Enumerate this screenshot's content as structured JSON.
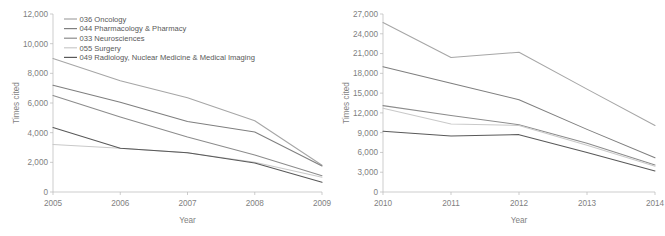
{
  "figure": {
    "panels": [
      "left",
      "right"
    ],
    "shared_legend_panel": "left"
  },
  "legend": {
    "entries": [
      {
        "label": "036 Oncology",
        "color": "#a6a6a6"
      },
      {
        "label": "044 Pharmacology & Pharmacy",
        "color": "#7f7f7f"
      },
      {
        "label": "033 Neurosciences",
        "color": "#8c8c8c"
      },
      {
        "label": "055 Surgery",
        "color": "#c9c9c9"
      },
      {
        "label": "049 Radiology, Nuclear Medicine & Medical Imaging",
        "color": "#595959"
      }
    ]
  },
  "chart_data": [
    {
      "type": "line",
      "panel": "left",
      "title": "",
      "xlabel": "Year",
      "ylabel": "Times cited",
      "categories": [
        "2005",
        "2006",
        "2007",
        "2008",
        "2009"
      ],
      "x": [
        2005,
        2006,
        2007,
        2008,
        2009
      ],
      "xlim": [
        2005,
        2009
      ],
      "ylim": [
        0,
        12000
      ],
      "yticks": [
        0,
        2000,
        4000,
        6000,
        8000,
        10000,
        12000
      ],
      "ytick_labels": [
        "0",
        "2,000",
        "4,000",
        "6,000",
        "8,000",
        "10,000",
        "12,000"
      ],
      "xticks": [
        2005,
        2006,
        2007,
        2008,
        2009
      ],
      "xtick_labels": [
        "2005",
        "2006",
        "2007",
        "2008",
        "2009"
      ],
      "grid": false,
      "legend_position": "top-left-inside",
      "series": [
        {
          "name": "036 Oncology",
          "color": "#a6a6a6",
          "values": [
            9000,
            7500,
            6350,
            4800,
            1800
          ]
        },
        {
          "name": "044 Pharmacology & Pharmacy",
          "color": "#7f7f7f",
          "values": [
            7200,
            6050,
            4750,
            4050,
            1750
          ]
        },
        {
          "name": "033 Neurosciences",
          "color": "#8c8c8c",
          "values": [
            6500,
            5050,
            3700,
            2500,
            1100
          ]
        },
        {
          "name": "055 Surgery",
          "color": "#c9c9c9",
          "values": [
            3200,
            2950,
            2650,
            2000,
            1000
          ]
        },
        {
          "name": "049 Radiology, Nuclear Medicine & Medical Imaging",
          "color": "#595959",
          "values": [
            4350,
            2950,
            2650,
            1950,
            650
          ]
        }
      ]
    },
    {
      "type": "line",
      "panel": "right",
      "title": "",
      "xlabel": "Year",
      "ylabel": "Times cited",
      "categories": [
        "2010",
        "2011",
        "2012",
        "2013",
        "2014"
      ],
      "x": [
        2010,
        2011,
        2012,
        2013,
        2014
      ],
      "xlim": [
        2010,
        2014
      ],
      "ylim": [
        0,
        27000
      ],
      "yticks": [
        0,
        3000,
        6000,
        9000,
        12000,
        15000,
        18000,
        21000,
        24000,
        27000
      ],
      "ytick_labels": [
        "0",
        "3,000",
        "6,000",
        "9,000",
        "12,000",
        "15,000",
        "18,000",
        "21,000",
        "24,000",
        "27,000"
      ],
      "xticks": [
        2010,
        2011,
        2012,
        2013,
        2014
      ],
      "xtick_labels": [
        "2010",
        "2011",
        "2012",
        "2013",
        "2014"
      ],
      "grid": false,
      "legend_position": "none",
      "series": [
        {
          "name": "036 Oncology",
          "color": "#a6a6a6",
          "values": [
            25700,
            20400,
            21200,
            15600,
            10100
          ]
        },
        {
          "name": "044 Pharmacology & Pharmacy",
          "color": "#7f7f7f",
          "values": [
            19000,
            16500,
            14000,
            9500,
            5200
          ]
        },
        {
          "name": "033 Neurosciences",
          "color": "#8c8c8c",
          "values": [
            13100,
            11600,
            10200,
            7400,
            4100
          ]
        },
        {
          "name": "055 Surgery",
          "color": "#c9c9c9",
          "values": [
            12700,
            10300,
            10100,
            7100,
            3900
          ]
        },
        {
          "name": "049 Radiology, Nuclear Medicine & Medical Imaging",
          "color": "#595959",
          "values": [
            9200,
            8500,
            8700,
            6000,
            3200
          ]
        }
      ]
    }
  ]
}
